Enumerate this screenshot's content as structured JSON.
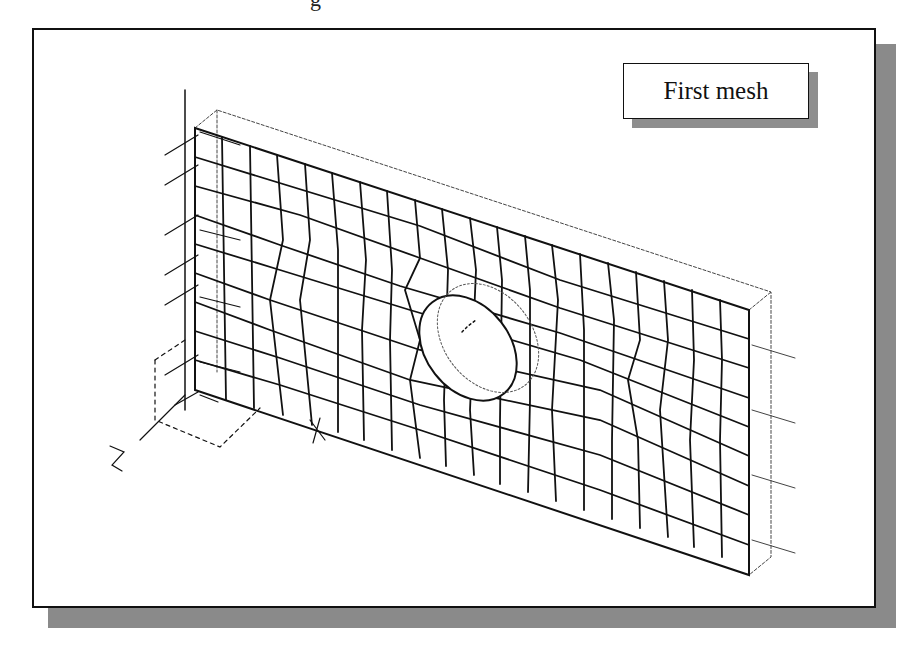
{
  "figure": {
    "title_fragment": "g",
    "label": "First mesh",
    "axes": {
      "x_label": "X",
      "z_label": "Z"
    },
    "colors": {
      "line": "#111111",
      "frame_shadow": "#8a8a8a",
      "background": "#ffffff"
    },
    "mesh": {
      "columns": 16,
      "rows": 9,
      "feature": "circular hole at plate center",
      "left_edge": "fixed constraints",
      "right_edge": "applied loads (4 arrows)"
    }
  }
}
